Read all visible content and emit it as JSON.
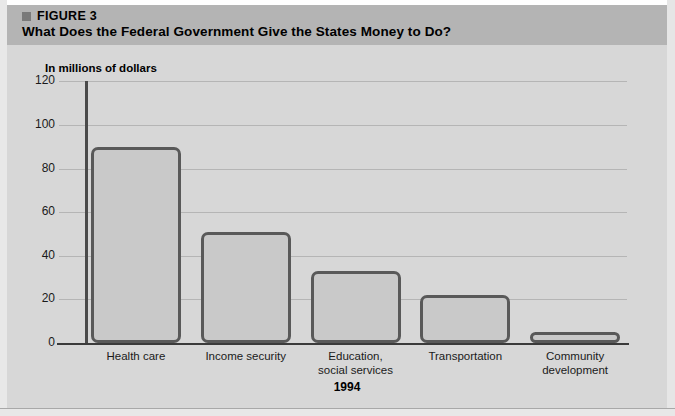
{
  "figure": {
    "bullet_icon": "square-bullet-icon",
    "label": "FIGURE 3",
    "title": "What Does the Federal Government Give the States Money to Do?"
  },
  "colors": {
    "header_band": "#b4b4b4",
    "panel_background": "#d7d7d7",
    "bar_fill": "#c9c9c9",
    "bar_outline": "#595959",
    "gridline": "#b5b5b5",
    "axis": "#3a3a3a"
  },
  "chart_data": {
    "type": "bar",
    "title": "What Does the Federal Government Give the States Money to Do?",
    "subtitle": "FIGURE 3",
    "xlabel": "1994",
    "ylabel": "In millions of dollars",
    "ylim": [
      0,
      120
    ],
    "yticks": [
      0,
      20,
      40,
      60,
      80,
      100,
      120
    ],
    "ytick_labels": [
      "0",
      "20",
      "40",
      "60",
      "80",
      "100",
      "120"
    ],
    "grid": true,
    "legend": "none",
    "categories": [
      "Health care",
      "Income security",
      "Education, social services",
      "Transportation",
      "Community development"
    ],
    "category_label_lines": [
      [
        "Health care"
      ],
      [
        "Income security"
      ],
      [
        "Education,",
        "social services"
      ],
      [
        "Transportation"
      ],
      [
        "Community",
        "development"
      ]
    ],
    "values": [
      90,
      51,
      33,
      22,
      5
    ]
  }
}
